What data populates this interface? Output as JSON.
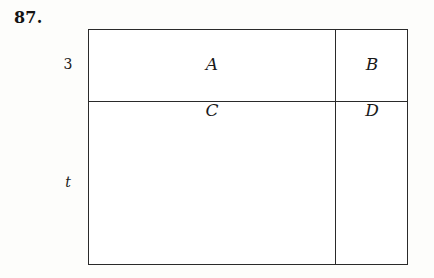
{
  "figure": {
    "problem_number": "87.",
    "side_labels": [
      {
        "name": "top-row-height",
        "text": "3",
        "style": "upright"
      },
      {
        "name": "bottom-row-height",
        "text": "t",
        "style": "italic"
      }
    ],
    "regions": [
      {
        "id": "a",
        "label": "A",
        "position": "top-left"
      },
      {
        "id": "b",
        "label": "B",
        "position": "top-right"
      },
      {
        "id": "c",
        "label": "C",
        "position": "bottom-left"
      },
      {
        "id": "d",
        "label": "D",
        "position": "bottom-right"
      }
    ],
    "colors": {
      "background": "#fdfdfb",
      "box_fill": "#ffffff",
      "stroke": "#2a2a2a",
      "text": "#1a1a1a"
    }
  }
}
